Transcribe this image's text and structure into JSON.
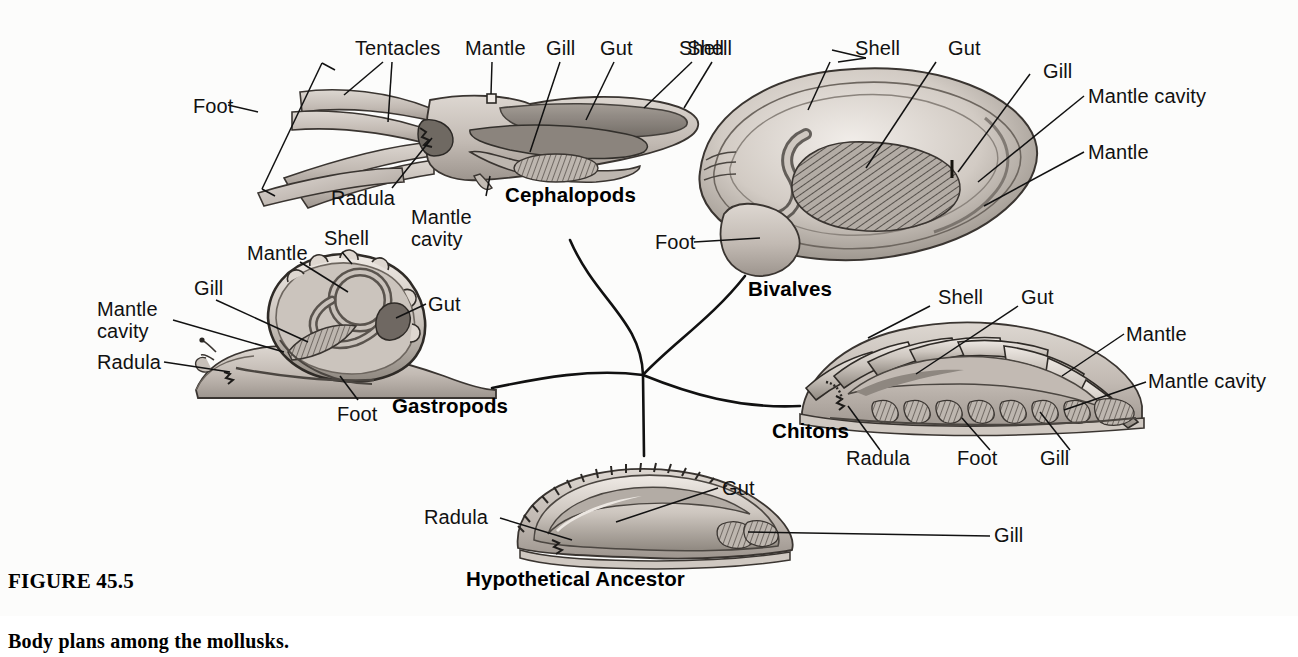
{
  "figure": {
    "number": "FIGURE 45.5",
    "caption": "Body plans among the mollusks."
  },
  "groups": [
    {
      "id": "cephalopods",
      "label": "Cephalopods"
    },
    {
      "id": "bivalves",
      "label": "Bivalves"
    },
    {
      "id": "gastropods",
      "label": "Gastropods"
    },
    {
      "id": "chitons",
      "label": "Chitons"
    },
    {
      "id": "ancestor",
      "label": "Hypothetical Ancestor"
    }
  ],
  "labels": {
    "cephalopod": {
      "foot": "Foot",
      "tentacles": "Tentacles",
      "mantle": "Mantle",
      "gill": "Gill",
      "gut": "Gut",
      "shell": "Shell",
      "radula": "Radula",
      "mantle_cavity_l1": "Mantle",
      "mantle_cavity_l2": "cavity"
    },
    "bivalve": {
      "shell_left": "Shell",
      "shell": "Shell",
      "gut": "Gut",
      "gill": "Gill",
      "mantle_cavity": "Mantle cavity",
      "mantle": "Mantle",
      "foot": "Foot"
    },
    "gastropod": {
      "mantle": "Mantle",
      "shell": "Shell",
      "gill": "Gill",
      "mantle_cavity_l1": "Mantle",
      "mantle_cavity_l2": "cavity",
      "radula": "Radula",
      "gut": "Gut",
      "foot": "Foot"
    },
    "chiton": {
      "shell": "Shell",
      "gut": "Gut",
      "mantle": "Mantle",
      "mantle_cavity": "Mantle cavity",
      "radula": "Radula",
      "foot": "Foot",
      "gill": "Gill"
    },
    "ancestor": {
      "radula": "Radula",
      "gut": "Gut",
      "gill": "Gill"
    }
  },
  "colors": {
    "background": "#fcfcfb",
    "ink": "#111111",
    "line": "#1a1a1a",
    "tissue_light": "#cfc9c4",
    "tissue_mid": "#a9a29c",
    "tissue_dark": "#7d766f",
    "shell_light": "#ded8d2",
    "shell_shade": "#9a938c"
  }
}
